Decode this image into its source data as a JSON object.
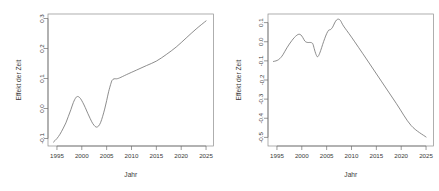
{
  "figure": {
    "background_color": "#ffffff",
    "line_color": "#707070",
    "axis_color": "#8c8c8c",
    "text_color": "#3a3a3a"
  },
  "chart_data": [
    {
      "type": "line",
      "panel": "left",
      "title": "",
      "xlabel": "Jahr",
      "ylabel": "Effekt der Zeit",
      "xlim": [
        1993.2,
        2026.5
      ],
      "ylim": [
        -0.125,
        0.315
      ],
      "xticks": [
        1995,
        2000,
        2005,
        2010,
        2015,
        2020,
        2025
      ],
      "xticklabels": [
        "1995",
        "2000",
        "2005",
        "2010",
        "2015",
        "2020",
        "2025"
      ],
      "yticks": [
        -0.1,
        0.0,
        0.1,
        0.2,
        0.3
      ],
      "yticklabels": [
        "-0.1",
        "0.0",
        "0.1",
        "0.2",
        "0.3"
      ],
      "grid": false,
      "legend": false,
      "x": [
        1994.3,
        1995.0,
        1995.6,
        1996.2,
        1996.8,
        1997.3,
        1997.8,
        1998.3,
        1998.8,
        1999.2,
        1999.7,
        2000.2,
        2000.7,
        2001.2,
        2001.7,
        2002.2,
        2002.7,
        2003.0,
        2003.4,
        2003.8,
        2004.2,
        2004.6,
        2005.0,
        2005.4,
        2005.8,
        2006.1,
        2006.5,
        2007.0,
        2007.6,
        2009.0,
        2011.0,
        2013.0,
        2015.0,
        2017.0,
        2019.0,
        2021.0,
        2023.0,
        2025.0
      ],
      "y": [
        -0.112,
        -0.1,
        -0.086,
        -0.068,
        -0.048,
        -0.026,
        -0.004,
        0.02,
        0.036,
        0.04,
        0.034,
        0.02,
        0.003,
        -0.016,
        -0.034,
        -0.05,
        -0.06,
        -0.062,
        -0.058,
        -0.046,
        -0.026,
        -0.002,
        0.026,
        0.056,
        0.08,
        0.094,
        0.099,
        0.099,
        0.102,
        0.113,
        0.128,
        0.143,
        0.158,
        0.18,
        0.205,
        0.235,
        0.265,
        0.292
      ]
    },
    {
      "type": "line",
      "panel": "right",
      "title": "",
      "xlabel": "Jahr",
      "ylabel": "Effekt der Zeit",
      "xlim": [
        1993.2,
        2026.5
      ],
      "ylim": [
        -0.545,
        0.145
      ],
      "xticks": [
        1995,
        2000,
        2005,
        2010,
        2015,
        2020,
        2025
      ],
      "xticklabels": [
        "1995",
        "2000",
        "2005",
        "2010",
        "2015",
        "2020",
        "2025"
      ],
      "yticks": [
        -0.5,
        -0.4,
        -0.3,
        -0.2,
        -0.1,
        0.0,
        0.1
      ],
      "yticklabels": [
        "-0.5",
        "-0.4",
        "-0.3",
        "-0.2",
        "-0.1",
        "0.0",
        "0.1"
      ],
      "grid": false,
      "legend": false,
      "x": [
        1994.3,
        1994.8,
        1995.3,
        1995.8,
        1996.2,
        1996.6,
        1997.0,
        1997.5,
        1998.0,
        1998.5,
        1999.0,
        1999.4,
        1999.8,
        2000.2,
        2000.6,
        2001.0,
        2001.4,
        2001.8,
        2002.2,
        2002.5,
        2002.8,
        2003.1,
        2003.4,
        2003.8,
        2004.2,
        2004.6,
        2005.0,
        2005.4,
        2005.8,
        2006.2,
        2006.6,
        2007.0,
        2007.4,
        2007.8,
        2008.4,
        2010.0,
        2013.0,
        2016.0,
        2019.0,
        2022.0,
        2025.0
      ],
      "y": [
        -0.103,
        -0.1,
        -0.094,
        -0.082,
        -0.068,
        -0.05,
        -0.032,
        -0.012,
        0.006,
        0.022,
        0.034,
        0.039,
        0.036,
        0.022,
        0.004,
        -0.003,
        -0.004,
        -0.004,
        -0.01,
        -0.036,
        -0.062,
        -0.078,
        -0.072,
        -0.046,
        -0.014,
        0.016,
        0.042,
        0.06,
        0.064,
        0.076,
        0.098,
        0.114,
        0.118,
        0.11,
        0.082,
        0.024,
        -0.09,
        -0.206,
        -0.322,
        -0.438,
        -0.498
      ]
    }
  ]
}
